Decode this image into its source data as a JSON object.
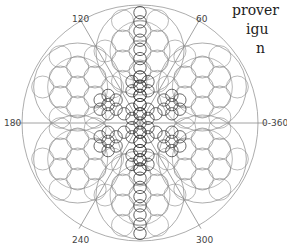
{
  "diagram": {
    "center": [
      140,
      123
    ],
    "outer_radius": 118,
    "stroke_color": "#8a8a8a",
    "dark_stroke_color": "#3a3a3a",
    "axes": [
      {
        "angle": 0,
        "label": "0-360"
      },
      {
        "angle": 60,
        "label": "60"
      },
      {
        "angle": 120,
        "label": "120"
      },
      {
        "angle": 180,
        "label": "180"
      },
      {
        "angle": 240,
        "label": "240"
      },
      {
        "angle": 300,
        "label": "300"
      }
    ],
    "label_positions": {
      "0": [
        262,
        126
      ],
      "60": [
        196,
        22
      ],
      "120": [
        72,
        22
      ],
      "180": [
        4,
        126
      ],
      "240": [
        72,
        243
      ],
      "300": [
        196,
        243
      ]
    }
  },
  "side_text": [
    "prover",
    "igu",
    "n"
  ]
}
